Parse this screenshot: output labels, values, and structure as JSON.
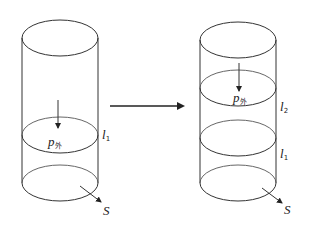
{
  "diagram": {
    "transition_arrow": "right-arrow",
    "left_cylinder": {
      "pressure_label": "p",
      "pressure_subscript": "外",
      "length_label": "l",
      "length_subscript": "1",
      "area_label": "S"
    },
    "right_cylinder": {
      "pressure_label": "p",
      "pressure_subscript": "外",
      "upper_length_label": "l",
      "upper_length_subscript": "2",
      "lower_length_label": "l",
      "lower_length_subscript": "1",
      "area_label": "S"
    },
    "colors": {
      "line": "#333333",
      "background": "#ffffff"
    }
  }
}
